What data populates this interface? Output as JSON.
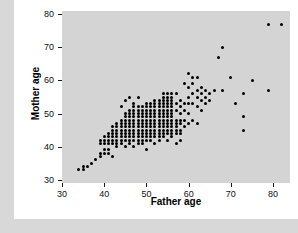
{
  "chart_data": {
    "type": "scatter",
    "title": "",
    "xlabel": "Father age",
    "ylabel": "Mother age",
    "xlim": [
      30,
      84
    ],
    "ylim": [
      29,
      81
    ],
    "xticks": [
      30,
      40,
      50,
      60,
      70,
      80
    ],
    "yticks": [
      30,
      40,
      50,
      60,
      70,
      80
    ],
    "grid": false,
    "legend": null,
    "panel_background": "#d4d4d4",
    "point_color": "#000000",
    "series": [
      {
        "name": "parent ages",
        "x": [
          34,
          35,
          35,
          36,
          37,
          38,
          39,
          39,
          39,
          39,
          40,
          40,
          40,
          40,
          40,
          41,
          41,
          41,
          41,
          41,
          41,
          42,
          42,
          42,
          42,
          42,
          42,
          42,
          43,
          43,
          43,
          43,
          43,
          43,
          43,
          43,
          44,
          44,
          44,
          44,
          44,
          44,
          44,
          44,
          44,
          45,
          45,
          45,
          45,
          45,
          45,
          45,
          45,
          45,
          45,
          45,
          46,
          46,
          46,
          46,
          46,
          46,
          46,
          46,
          46,
          46,
          46,
          46,
          47,
          47,
          47,
          47,
          47,
          47,
          47,
          47,
          47,
          47,
          47,
          47,
          47,
          48,
          48,
          48,
          48,
          48,
          48,
          48,
          48,
          48,
          48,
          48,
          48,
          48,
          49,
          49,
          49,
          49,
          49,
          49,
          49,
          49,
          49,
          49,
          49,
          49,
          50,
          50,
          50,
          50,
          50,
          50,
          50,
          50,
          50,
          50,
          50,
          50,
          50,
          51,
          51,
          51,
          51,
          51,
          51,
          51,
          51,
          51,
          51,
          51,
          51,
          52,
          52,
          52,
          52,
          52,
          52,
          52,
          52,
          52,
          52,
          52,
          52,
          52,
          53,
          53,
          53,
          53,
          53,
          53,
          53,
          53,
          53,
          53,
          53,
          53,
          53,
          54,
          54,
          54,
          54,
          54,
          54,
          54,
          54,
          54,
          54,
          54,
          54,
          54,
          54,
          55,
          55,
          55,
          55,
          55,
          55,
          55,
          55,
          55,
          55,
          55,
          55,
          55,
          55,
          56,
          56,
          56,
          56,
          56,
          56,
          56,
          56,
          56,
          56,
          56,
          56,
          56,
          56,
          57,
          57,
          57,
          57,
          57,
          57,
          57,
          57,
          57,
          58,
          58,
          58,
          58,
          58,
          58,
          58,
          58,
          59,
          59,
          59,
          59,
          59,
          60,
          60,
          60,
          60,
          60,
          60,
          61,
          61,
          61,
          61,
          61,
          62,
          62,
          62,
          62,
          62,
          63,
          63,
          63,
          63,
          64,
          64,
          64,
          65,
          65,
          66,
          67,
          68,
          68,
          70,
          71,
          73,
          73,
          73,
          75,
          79,
          79,
          82
        ],
        "y": [
          33,
          33,
          34,
          34,
          35,
          36,
          37,
          38,
          41,
          42,
          38,
          39,
          41,
          42,
          43,
          38,
          39,
          41,
          42,
          43,
          44,
          37,
          41,
          42,
          43,
          44,
          45,
          46,
          40,
          41,
          42,
          43,
          44,
          45,
          46,
          47,
          41,
          42,
          43,
          44,
          45,
          46,
          47,
          48,
          52,
          40,
          42,
          43,
          44,
          45,
          46,
          47,
          48,
          49,
          50,
          54,
          41,
          42,
          43,
          44,
          45,
          46,
          47,
          48,
          49,
          50,
          51,
          55,
          40,
          42,
          43,
          44,
          45,
          46,
          47,
          48,
          49,
          50,
          51,
          52,
          53,
          41,
          42,
          43,
          44,
          45,
          46,
          47,
          48,
          49,
          50,
          51,
          52,
          55,
          41,
          42,
          43,
          44,
          45,
          46,
          47,
          48,
          49,
          50,
          51,
          52,
          39,
          42,
          43,
          44,
          45,
          46,
          47,
          48,
          49,
          50,
          51,
          52,
          53,
          42,
          43,
          44,
          45,
          46,
          47,
          48,
          49,
          50,
          51,
          52,
          53,
          41,
          43,
          44,
          45,
          46,
          47,
          48,
          49,
          50,
          51,
          52,
          53,
          54,
          42,
          43,
          44,
          45,
          46,
          47,
          48,
          49,
          50,
          51,
          52,
          53,
          54,
          43,
          44,
          45,
          46,
          47,
          48,
          49,
          50,
          51,
          52,
          53,
          54,
          55,
          56,
          42,
          44,
          45,
          46,
          47,
          48,
          49,
          50,
          51,
          52,
          53,
          54,
          55,
          56,
          43,
          44,
          45,
          46,
          47,
          48,
          49,
          50,
          51,
          52,
          53,
          54,
          55,
          56,
          41,
          44,
          45,
          46,
          47,
          48,
          51,
          53,
          56,
          42,
          44,
          45,
          47,
          48,
          50,
          52,
          54,
          46,
          48,
          51,
          53,
          59,
          47,
          50,
          53,
          55,
          58,
          62,
          48,
          53,
          56,
          59,
          61,
          47,
          52,
          55,
          57,
          61,
          51,
          54,
          56,
          58,
          53,
          55,
          57,
          54,
          56,
          57,
          67,
          57,
          70,
          61,
          53,
          45,
          49,
          56,
          60,
          57,
          77,
          77
        ]
      }
    ]
  },
  "axis": {
    "x": {
      "title": "Father age",
      "ticks": [
        "30",
        "40",
        "50",
        "60",
        "70",
        "80"
      ]
    },
    "y": {
      "title": "Mother age",
      "ticks": [
        "30",
        "40",
        "50",
        "60",
        "70",
        "80"
      ]
    }
  }
}
